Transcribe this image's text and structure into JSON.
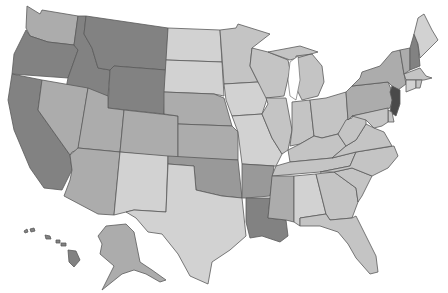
{
  "map": {
    "type": "choropleth",
    "region": "United States",
    "style": "grayscale",
    "shade_levels": {
      "lightest": "#d2d2d2",
      "light": "#c4c4c4",
      "medium": "#acacac",
      "medium_dark": "#999999",
      "dark": "#828282",
      "darkest": "#4a4a4a"
    },
    "states": [
      {
        "id": "WA",
        "name": "Washington",
        "shade": "medium"
      },
      {
        "id": "OR",
        "name": "Oregon",
        "shade": "dark"
      },
      {
        "id": "CA",
        "name": "California",
        "shade": "dark"
      },
      {
        "id": "ID",
        "name": "Idaho",
        "shade": "dark"
      },
      {
        "id": "NV",
        "name": "Nevada",
        "shade": "medium"
      },
      {
        "id": "MT",
        "name": "Montana",
        "shade": "dark"
      },
      {
        "id": "WY",
        "name": "Wyoming",
        "shade": "dark"
      },
      {
        "id": "UT",
        "name": "Utah",
        "shade": "medium"
      },
      {
        "id": "AZ",
        "name": "Arizona",
        "shade": "medium"
      },
      {
        "id": "CO",
        "name": "Colorado",
        "shade": "medium"
      },
      {
        "id": "NM",
        "name": "New Mexico",
        "shade": "lightest"
      },
      {
        "id": "ND",
        "name": "North Dakota",
        "shade": "lightest"
      },
      {
        "id": "SD",
        "name": "South Dakota",
        "shade": "lightest"
      },
      {
        "id": "NE",
        "name": "Nebraska",
        "shade": "medium"
      },
      {
        "id": "KS",
        "name": "Kansas",
        "shade": "medium"
      },
      {
        "id": "OK",
        "name": "Oklahoma",
        "shade": "medium_dark"
      },
      {
        "id": "TX",
        "name": "Texas",
        "shade": "lightest"
      },
      {
        "id": "MN",
        "name": "Minnesota",
        "shade": "light"
      },
      {
        "id": "IA",
        "name": "Iowa",
        "shade": "lightest"
      },
      {
        "id": "MO",
        "name": "Missouri",
        "shade": "lightest"
      },
      {
        "id": "AR",
        "name": "Arkansas",
        "shade": "medium_dark"
      },
      {
        "id": "LA",
        "name": "Louisiana",
        "shade": "dark"
      },
      {
        "id": "WI",
        "name": "Wisconsin",
        "shade": "light"
      },
      {
        "id": "IL",
        "name": "Illinois",
        "shade": "light"
      },
      {
        "id": "MI",
        "name": "Michigan",
        "shade": "light"
      },
      {
        "id": "IN",
        "name": "Indiana",
        "shade": "light"
      },
      {
        "id": "OH",
        "name": "Ohio",
        "shade": "light"
      },
      {
        "id": "KY",
        "name": "Kentucky",
        "shade": "light"
      },
      {
        "id": "TN",
        "name": "Tennessee",
        "shade": "light"
      },
      {
        "id": "MS",
        "name": "Mississippi",
        "shade": "medium"
      },
      {
        "id": "AL",
        "name": "Alabama",
        "shade": "lightest"
      },
      {
        "id": "GA",
        "name": "Georgia",
        "shade": "light"
      },
      {
        "id": "FL",
        "name": "Florida",
        "shade": "light"
      },
      {
        "id": "SC",
        "name": "South Carolina",
        "shade": "light"
      },
      {
        "id": "NC",
        "name": "North Carolina",
        "shade": "light"
      },
      {
        "id": "VA",
        "name": "Virginia",
        "shade": "light"
      },
      {
        "id": "WV",
        "name": "West Virginia",
        "shade": "light"
      },
      {
        "id": "PA",
        "name": "Pennsylvania",
        "shade": "medium"
      },
      {
        "id": "NY",
        "name": "New York",
        "shade": "medium"
      },
      {
        "id": "NJ",
        "name": "New Jersey",
        "shade": "darkest"
      },
      {
        "id": "DE",
        "name": "Delaware",
        "shade": "light"
      },
      {
        "id": "MD",
        "name": "Maryland",
        "shade": "light"
      },
      {
        "id": "VT",
        "name": "Vermont",
        "shade": "medium"
      },
      {
        "id": "NH",
        "name": "New Hampshire",
        "shade": "dark"
      },
      {
        "id": "ME",
        "name": "Maine",
        "shade": "lightest"
      },
      {
        "id": "MA",
        "name": "Massachusetts",
        "shade": "light"
      },
      {
        "id": "CT",
        "name": "Connecticut",
        "shade": "lightest"
      },
      {
        "id": "RI",
        "name": "Rhode Island",
        "shade": "light"
      },
      {
        "id": "AK",
        "name": "Alaska",
        "shade": "medium"
      },
      {
        "id": "HI",
        "name": "Hawaii",
        "shade": "dark"
      }
    ]
  }
}
